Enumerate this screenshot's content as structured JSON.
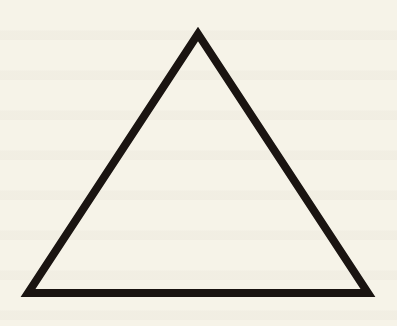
{
  "figure": {
    "shape": "triangle",
    "kind": "equilateral-outline",
    "vertices": [
      [
        198,
        34
      ],
      [
        28,
        293
      ],
      [
        368,
        293
      ]
    ],
    "stroke_width": 8,
    "stroke_color": "#1a1411",
    "fill": "none",
    "background_color": "#f6f3e8"
  }
}
